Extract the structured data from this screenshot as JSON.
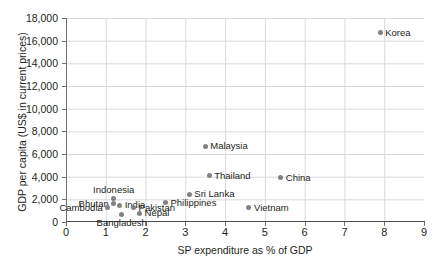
{
  "chart_data": {
    "type": "scatter",
    "title": "",
    "xlabel": "SP expenditure as % of GDP",
    "ylabel": "GDP per capita (US$ in current prices)",
    "xlim": [
      0,
      9
    ],
    "ylim": [
      0,
      18000
    ],
    "grid": true,
    "legend": "none",
    "xticks": [
      "0",
      "1",
      "2",
      "3",
      "4",
      "5",
      "6",
      "7",
      "8",
      "9"
    ],
    "xtick_values": [
      0,
      1,
      2,
      3,
      4,
      5,
      6,
      7,
      8,
      9
    ],
    "yticks": [
      "0",
      "2,000",
      "4,000",
      "6,000",
      "8,000",
      "10,000",
      "12,000",
      "14,000",
      "16,000",
      "18,000"
    ],
    "ytick_values": [
      0,
      2000,
      4000,
      6000,
      8000,
      10000,
      12000,
      14000,
      16000,
      18000
    ],
    "marker_color": "#808285",
    "points": [
      {
        "label": "Korea",
        "x": 7.9,
        "y": 16700,
        "label_pos": "right"
      },
      {
        "label": "Malaysia",
        "x": 3.5,
        "y": 6700,
        "label_pos": "right"
      },
      {
        "label": "Thailand",
        "x": 3.6,
        "y": 4100,
        "label_pos": "right"
      },
      {
        "label": "China",
        "x": 5.4,
        "y": 3900,
        "label_pos": "right"
      },
      {
        "label": "Sri Lanka",
        "x": 3.1,
        "y": 2450,
        "label_pos": "right"
      },
      {
        "label": "Philippines",
        "x": 2.5,
        "y": 1700,
        "label_pos": "right"
      },
      {
        "label": "Vietnam",
        "x": 4.6,
        "y": 1250,
        "label_pos": "right"
      },
      {
        "label": "Indonesia",
        "x": 1.2,
        "y": 2050,
        "label_pos": "above"
      },
      {
        "label": "Bhutan",
        "x": 1.2,
        "y": 1600,
        "label_pos": "left"
      },
      {
        "label": "India",
        "x": 1.35,
        "y": 1500,
        "label_pos": "right"
      },
      {
        "label": "Cambodia",
        "x": 1.05,
        "y": 1250,
        "label_pos": "left"
      },
      {
        "label": "Pakistan",
        "x": 1.7,
        "y": 1250,
        "label_pos": "right"
      },
      {
        "label": "Bangladesh",
        "x": 1.4,
        "y": 700,
        "label_pos": "below"
      },
      {
        "label": "Nepal",
        "x": 1.85,
        "y": 780,
        "label_pos": "right"
      }
    ]
  }
}
